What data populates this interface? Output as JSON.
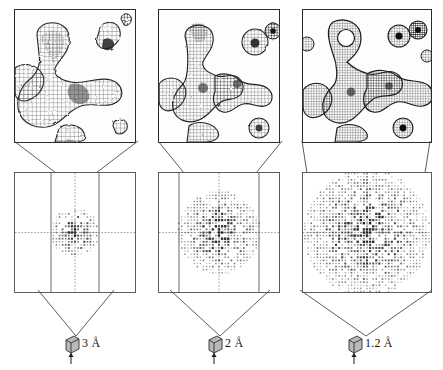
{
  "figure": {
    "background_color": "#ffffff",
    "line_color": "#4a4a4a",
    "mesh_color": "#2b2b2b"
  },
  "columns": [
    {
      "id": "col-0",
      "resolution_label": "3 Å",
      "resolution_value": 3.0,
      "crystal_icon": "crystal-cube-icon",
      "beam_icon": "xray-beam-icon",
      "detector": {
        "spot_extent_fraction": 0.34,
        "spot_count": 140,
        "lattice_step": 3.1,
        "cone_half_width_fraction": 0.18
      },
      "density": {
        "mesh_detail": "coarse",
        "ring_hole_visible": false,
        "caption": "Blobby, featureless density; side chains unresolved"
      }
    },
    {
      "id": "col-1",
      "resolution_label": "2 Å",
      "resolution_value": 2.0,
      "crystal_icon": "crystal-cube-icon",
      "beam_icon": "xray-beam-icon",
      "detector": {
        "spot_extent_fraction": 0.58,
        "spot_count": 360,
        "lattice_step": 3.1,
        "cone_half_width_fraction": 0.3
      },
      "density": {
        "mesh_detail": "medium",
        "ring_hole_visible": false,
        "caption": "Individual groups resolved; ring still filled"
      }
    },
    {
      "id": "col-2",
      "resolution_label": "1.2 Å",
      "resolution_value": 1.2,
      "crystal_icon": "crystal-cube-icon",
      "beam_icon": "xray-beam-icon",
      "detector": {
        "spot_extent_fraction": 0.88,
        "spot_count": 760,
        "lattice_step": 3.1,
        "cone_half_width_fraction": 0.47
      },
      "density": {
        "mesh_detail": "fine",
        "ring_hole_visible": true,
        "caption": "Atomic detail; hole visible in the aromatic ring"
      }
    }
  ],
  "chart_data": {
    "type": "scatter",
    "xlabel": "Resolution (Å)",
    "ylabel": "Fraction of detector covered by reflections",
    "x": [
      3.0,
      2.0,
      1.2
    ],
    "categories": [
      "3 Å",
      "2 Å",
      "1.2 Å"
    ],
    "series": [
      {
        "name": "Spot extent fraction",
        "values": [
          0.34,
          0.58,
          0.88
        ]
      },
      {
        "name": "Reflection count",
        "values": [
          140,
          360,
          760
        ]
      }
    ],
    "grid": false,
    "legend": "none"
  }
}
